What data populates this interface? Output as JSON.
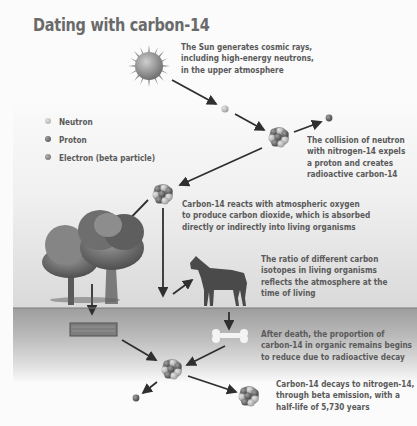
{
  "title": "Dating with carbon-14",
  "legend": [
    {
      "label": "Neutron",
      "color": "#b9b9b9",
      "icon": "neutron-dot-icon"
    },
    {
      "label": "Proton",
      "color": "#6e6e6e",
      "icon": "proton-dot-icon"
    },
    {
      "label": "Electron (beta particle)",
      "color": "#8a8a8a",
      "icon": "electron-dot-icon"
    }
  ],
  "steps": [
    {
      "id": "sun",
      "lines": [
        "The Sun generates cosmic rays,",
        "including high-energy neutrons,",
        "in the upper atmosphere"
      ]
    },
    {
      "id": "collision",
      "lines": [
        "The collision of neutron",
        "with nitrogen-14 expels",
        "a proton and creates",
        "radioactive carbon-14"
      ]
    },
    {
      "id": "co2",
      "lines": [
        "Carbon-14 reacts with atmospheric oxygen",
        "to produce carbon dioxide, which is absorbed",
        "directly or indirectly into living organisms"
      ]
    },
    {
      "id": "ratio",
      "lines": [
        "The ratio of different carbon",
        "isotopes in living organisms",
        "reflects the atmosphere at the",
        "time of living"
      ]
    },
    {
      "id": "death",
      "lines": [
        "After death, the proportion of",
        "carbon-14 in organic remains begins",
        "to reduce due to radioactive decay"
      ]
    },
    {
      "id": "decay",
      "lines": [
        "Carbon-14 decays to nitrogen-14,",
        "through beta emission, with a",
        "half-life of 5,730 years"
      ]
    }
  ],
  "illustrations": [
    "sun-icon",
    "neutron-icon",
    "nitrogen-nucleus-icon",
    "proton-icon",
    "carbon-14-nucleus-icon",
    "tree-icon",
    "horse-icon",
    "wood-log-icon",
    "bone-icon",
    "electron-icon",
    "nitrogen-14-nucleus-icon"
  ],
  "colors": {
    "text": "#5a5a5a",
    "title": "#6a6a6a",
    "arrow": "#2f2f2f",
    "ground": "#9e9e9e"
  }
}
